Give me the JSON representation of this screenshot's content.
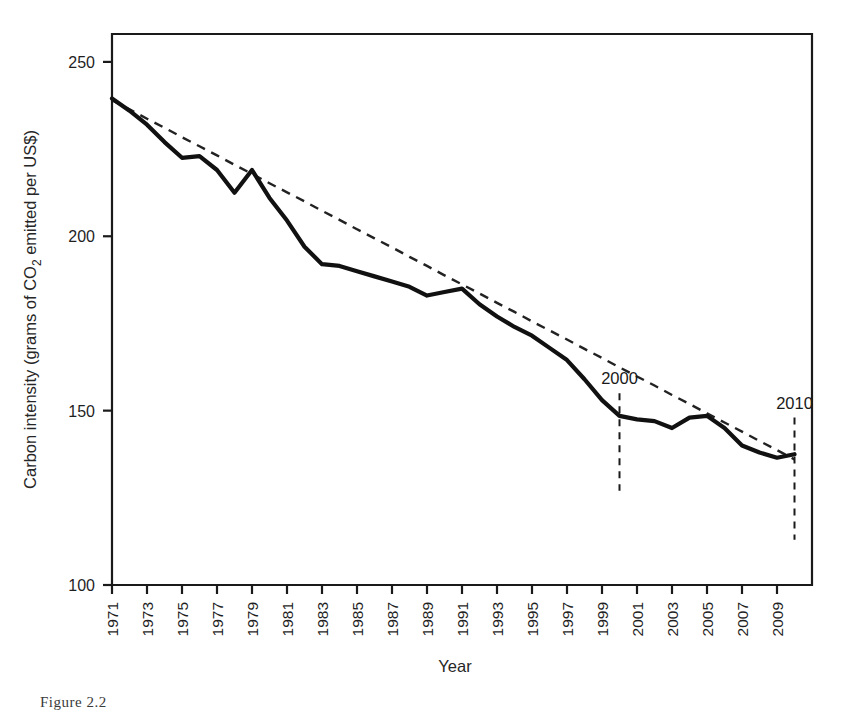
{
  "figure": {
    "caption": "Figure 2.2",
    "background": "#ffffff",
    "line_color": "#111111",
    "trend_color": "#222222",
    "frame_color": "#1a1a1a"
  },
  "chart_data": {
    "type": "line",
    "title": "",
    "xlabel": "Year",
    "ylabel": "Carbon intensity (grams of CO2 emitted per US$)",
    "ylabel_parts": {
      "before": "Carbon intensity (grams of CO",
      "sub": "2",
      "after": " emitted per US$)"
    },
    "xlim": [
      1971,
      2011
    ],
    "ylim": [
      100,
      258
    ],
    "ytick_values": [
      100,
      150,
      200,
      250
    ],
    "ytick_labels": [
      "100",
      "150",
      "200",
      "250"
    ],
    "xtick_labels": [
      "1971",
      "1973",
      "1975",
      "1977",
      "1979",
      "1981",
      "1983",
      "1985",
      "1987",
      "1989",
      "1991",
      "1993",
      "1995",
      "1997",
      "1999",
      "2001",
      "2003",
      "2005",
      "2007",
      "2009"
    ],
    "xtick_values": [
      1971,
      1973,
      1975,
      1977,
      1979,
      1981,
      1983,
      1985,
      1987,
      1989,
      1991,
      1993,
      1995,
      1997,
      1999,
      2001,
      2003,
      2005,
      2007,
      2009
    ],
    "grid": false,
    "legend": null,
    "x": [
      1971,
      1972,
      1973,
      1974,
      1975,
      1976,
      1977,
      1978,
      1979,
      1980,
      1981,
      1982,
      1983,
      1984,
      1985,
      1986,
      1987,
      1988,
      1989,
      1990,
      1991,
      1992,
      1993,
      1994,
      1995,
      1996,
      1997,
      1998,
      1999,
      2000,
      2001,
      2002,
      2003,
      2004,
      2005,
      2006,
      2007,
      2008,
      2009,
      2010
    ],
    "series": [
      {
        "name": "Carbon intensity",
        "style": "solid",
        "values": [
          239.5,
          236.0,
          232.0,
          227.0,
          222.5,
          223.0,
          219.0,
          212.5,
          219.0,
          211.0,
          204.5,
          197.0,
          192.0,
          191.5,
          190.0,
          188.5,
          187.0,
          185.5,
          183.0,
          184.0,
          185.0,
          180.5,
          177.0,
          174.0,
          171.5,
          168.0,
          164.5,
          159.0,
          153.0,
          148.5,
          147.5,
          147.0,
          145.0,
          148.0,
          148.5,
          145.0,
          140.0,
          138.0,
          136.5,
          137.5
        ]
      },
      {
        "name": "Linear trend",
        "style": "dashed",
        "values": [
          239.0,
          236.4,
          233.7,
          231.1,
          228.4,
          225.8,
          223.2,
          220.5,
          217.9,
          215.2,
          212.6,
          210.0,
          207.3,
          204.7,
          202.0,
          199.4,
          196.8,
          194.1,
          191.5,
          188.8,
          186.2,
          183.6,
          180.9,
          178.3,
          175.6,
          173.0,
          170.4,
          167.7,
          165.1,
          162.4,
          159.8,
          157.2,
          154.5,
          151.9,
          149.2,
          146.6,
          144.0,
          141.3,
          138.7,
          136.0
        ]
      }
    ],
    "annotations": [
      {
        "label": "2000",
        "x": 2000,
        "line_top": 155,
        "line_bottom": 127
      },
      {
        "label": "2010",
        "x": 2010,
        "line_top": 148,
        "line_bottom": 113
      }
    ]
  }
}
